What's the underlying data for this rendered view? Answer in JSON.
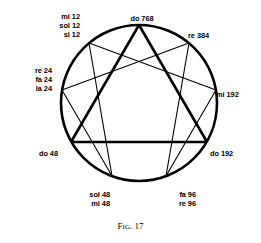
{
  "figure": {
    "caption_prefix": "F",
    "caption_small": "IG",
    "caption_rest": ". 17",
    "caption_full": "FIG. 17",
    "type": "enneagram",
    "stroke_color": "#000000",
    "background_color": "#ffffff"
  },
  "circle": {
    "center_x": 139,
    "center_y": 103,
    "radius": 78,
    "stroke_width": 2.6
  },
  "nodes": [
    {
      "id": "do768",
      "position": 9,
      "angle_deg": -90,
      "cx": 139,
      "cy": 25,
      "label_lines": [
        "do 768"
      ],
      "align": "center"
    },
    {
      "id": "re384",
      "position": 1,
      "angle_deg": -50,
      "cx": 189,
      "cy": 43,
      "label_lines": [
        "re 384"
      ],
      "align": "left"
    },
    {
      "id": "mi192",
      "position": 2,
      "angle_deg": -10,
      "cx": 216,
      "cy": 90,
      "label_lines": [
        "mi 192"
      ],
      "align": "left"
    },
    {
      "id": "do192",
      "position": 3,
      "angle_deg": 30,
      "cx": 207,
      "cy": 142,
      "label_lines": [
        "do 192"
      ],
      "align": "left"
    },
    {
      "id": "fa96",
      "position": 4,
      "angle_deg": 70,
      "cx": 166,
      "cy": 176,
      "label_lines": [
        "fa 96",
        "re 96"
      ],
      "align": "left"
    },
    {
      "id": "sol48",
      "position": 5,
      "angle_deg": 110,
      "cx": 112,
      "cy": 176,
      "label_lines": [
        "sol 48",
        "mi 48"
      ],
      "align": "left"
    },
    {
      "id": "do48",
      "position": 6,
      "angle_deg": 150,
      "cx": 71,
      "cy": 142,
      "label_lines": [
        "do 48"
      ],
      "align": "right"
    },
    {
      "id": "re24",
      "position": 7,
      "angle_deg": 190,
      "cx": 62,
      "cy": 90,
      "label_lines": [
        "re 24",
        "fa 24",
        "la 24"
      ],
      "align": "right"
    },
    {
      "id": "mi12",
      "position": 8,
      "angle_deg": 230,
      "cx": 89,
      "cy": 43,
      "label_lines": [
        "mi 12",
        "sol 12",
        "si 12"
      ],
      "align": "right"
    }
  ],
  "labels": {
    "do768": {
      "lines": [
        "do 768"
      ]
    },
    "re384": {
      "lines": [
        "re 384"
      ]
    },
    "mi192": {
      "lines": [
        "mi 192"
      ]
    },
    "do192": {
      "lines": [
        "do 192"
      ]
    },
    "fa96": {
      "lines": [
        "fa 96",
        "re 96"
      ]
    },
    "sol48": {
      "lines": [
        "sol 48",
        "mi 48"
      ]
    },
    "do48": {
      "lines": [
        "do 48"
      ]
    },
    "re24": {
      "lines": [
        "re 24",
        "fa 24",
        "la 24"
      ]
    },
    "mi12": {
      "lines": [
        "mi 12",
        "sol 12",
        "si 12"
      ]
    }
  },
  "label_text": {
    "do768_l1": "do 768",
    "re384_l1": "re 384",
    "mi192_l1": "mi 192",
    "do192_l1": "do 192",
    "fa96_l1": "fa 96",
    "fa96_l2": "re 96",
    "sol48_l1": "sol 48",
    "sol48_l2": "mi 48",
    "do48_l1": "do 48",
    "re24_l1": "re 24",
    "re24_l2": "fa 24",
    "re24_l3": "la 24",
    "mi12_l1": "mi 12",
    "mi12_l2": "sol 12",
    "mi12_l3": "si 12"
  },
  "chords": {
    "triangle": {
      "name": "inner-triangle",
      "stroke_width": 2.6,
      "path": [
        "do768",
        "do192",
        "do48",
        "do768"
      ]
    },
    "hexad": {
      "name": "inner-hexad",
      "stroke_width": 1.1,
      "path": [
        "re384",
        "fa96",
        "mi192",
        "mi12",
        "sol48",
        "re24",
        "re384"
      ]
    }
  }
}
